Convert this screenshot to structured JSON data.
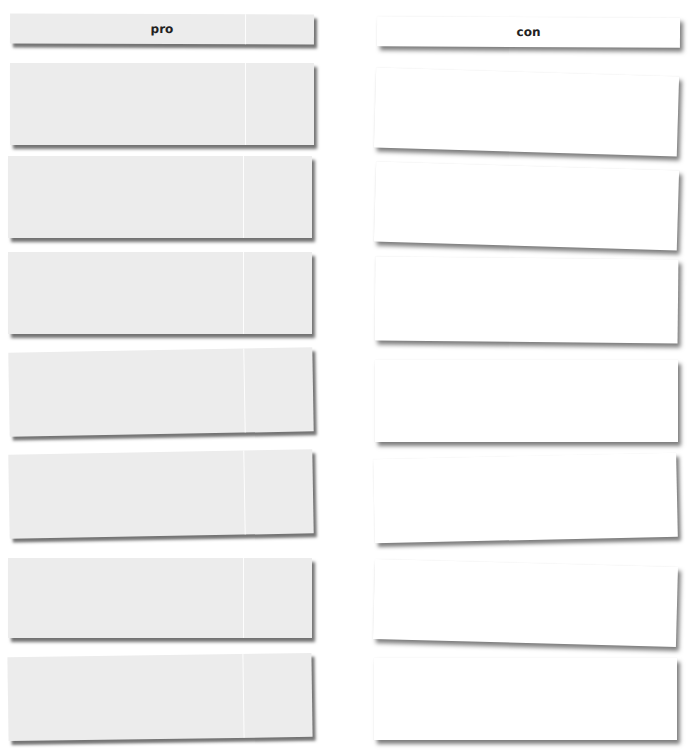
{
  "columns": [
    {
      "header": "pro",
      "cards": [
        "",
        "",
        "",
        "",
        "",
        "",
        ""
      ]
    },
    {
      "header": "con",
      "cards": [
        "",
        "",
        "",
        "",
        "",
        "",
        ""
      ]
    }
  ],
  "colors": {
    "pro_card": "#ececec",
    "con_card": "#ffffff",
    "text": "#222222"
  }
}
